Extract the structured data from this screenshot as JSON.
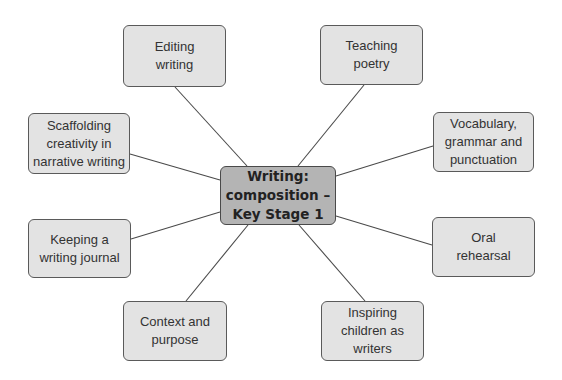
{
  "diagram": {
    "type": "mind-map",
    "colors": {
      "background": "#ffffff",
      "node_fill": "#e3e3e3",
      "center_fill": "#b4b4b4",
      "border": "#5a5a5a",
      "connector": "#4a4a4a",
      "text": "#333333"
    },
    "center": {
      "id": "center",
      "label": "Writing:\ncomposition –\nKey Stage 1",
      "box": {
        "x": 220,
        "y": 166,
        "w": 116,
        "h": 59
      }
    },
    "nodes": [
      {
        "id": "editing-writing",
        "label": "Editing\nwriting",
        "box": {
          "x": 123,
          "y": 25,
          "w": 103,
          "h": 62
        },
        "line": {
          "x1": 175,
          "y1": 87,
          "x2": 247,
          "y2": 166
        }
      },
      {
        "id": "teaching-poetry",
        "label": "Teaching\npoetry",
        "box": {
          "x": 320,
          "y": 25,
          "w": 103,
          "h": 60
        },
        "line": {
          "x1": 364,
          "y1": 85,
          "x2": 298,
          "y2": 166
        }
      },
      {
        "id": "scaffolding-creativity",
        "label": "Scaffolding\ncreativity in\nnarrative writing",
        "box": {
          "x": 28,
          "y": 113,
          "w": 102,
          "h": 61
        },
        "line": {
          "x1": 130,
          "y1": 154,
          "x2": 220,
          "y2": 180
        }
      },
      {
        "id": "vocabulary-grammar-punctuation",
        "label": "Vocabulary,\ngrammar and\npunctuation",
        "box": {
          "x": 433,
          "y": 112,
          "w": 101,
          "h": 60
        },
        "line": {
          "x1": 433,
          "y1": 146,
          "x2": 336,
          "y2": 176
        }
      },
      {
        "id": "keeping-writing-journal",
        "label": "Keeping a\nwriting journal",
        "box": {
          "x": 28,
          "y": 219,
          "w": 103,
          "h": 59
        },
        "line": {
          "x1": 131,
          "y1": 239,
          "x2": 220,
          "y2": 212
        }
      },
      {
        "id": "oral-rehearsal",
        "label": "Oral\nrehearsal",
        "box": {
          "x": 432,
          "y": 217,
          "w": 103,
          "h": 60
        },
        "line": {
          "x1": 432,
          "y1": 245,
          "x2": 336,
          "y2": 216
        }
      },
      {
        "id": "context-and-purpose",
        "label": "Context and\npurpose",
        "box": {
          "x": 123,
          "y": 301,
          "w": 104,
          "h": 60
        },
        "line": {
          "x1": 186,
          "y1": 301,
          "x2": 248,
          "y2": 225
        }
      },
      {
        "id": "inspiring-children-as-writers",
        "label": "Inspiring\nchildren as\nwriters",
        "box": {
          "x": 321,
          "y": 301,
          "w": 103,
          "h": 60
        },
        "line": {
          "x1": 365,
          "y1": 301,
          "x2": 299,
          "y2": 225
        }
      }
    ]
  }
}
